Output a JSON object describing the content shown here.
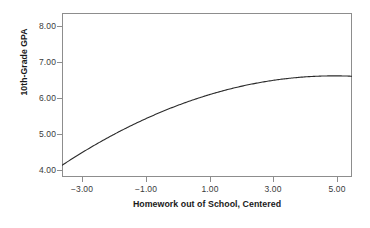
{
  "chart_data": {
    "type": "line",
    "title": "",
    "subtitle": "",
    "xlabel": "Homework out of School, Centered",
    "ylabel": "10th-Grade GPA",
    "xlim": [
      -3.63,
      5.47
    ],
    "ylim": [
      3.81,
      8.23
    ],
    "xticks": [
      -3,
      -1,
      1,
      3,
      5
    ],
    "yticks": [
      4,
      5,
      6,
      7,
      8
    ],
    "xtick_labels": [
      "−3.00",
      "−1.00",
      "1.00",
      "3.00",
      "5.00"
    ],
    "ytick_labels": [
      "4.00",
      "5.00",
      "6.00",
      "7.00",
      "8.00"
    ],
    "grid": false,
    "legend": false,
    "legend_position": "none",
    "series": [
      {
        "name": "Fitted quadratic curve",
        "color": "#2b2b2b",
        "equation": "y = 5.98 + 0.300x - 0.0420x^2",
        "x": [
          -3.63,
          -3.2,
          -2.8,
          -2.4,
          -2.0,
          -1.6,
          -1.2,
          -1.0,
          -0.6,
          -0.2,
          0.2,
          0.6,
          1.0,
          1.4,
          1.8,
          2.2,
          2.6,
          3.0,
          3.4,
          3.8,
          4.2,
          4.6,
          5.0,
          5.47
        ],
        "y": [
          4.34,
          4.59,
          4.81,
          5.02,
          5.21,
          5.39,
          5.56,
          5.64,
          5.78,
          5.92,
          6.04,
          6.14,
          6.24,
          6.32,
          6.4,
          6.46,
          6.51,
          6.5,
          6.52,
          6.52,
          6.51,
          6.48,
          6.43,
          6.36
        ]
      }
    ],
    "measured_points": [
      {
        "x": -3.63,
        "y": 4.15
      },
      {
        "x": -1.0,
        "y": 5.34
      },
      {
        "x": 1.0,
        "y": 6.0
      },
      {
        "x": 3.7,
        "y": 6.59
      },
      {
        "x": 5.47,
        "y": 6.47
      }
    ],
    "axis_color": "#8d8d8d",
    "curve_color": "#2b2b2b",
    "background": "#ffffff"
  }
}
